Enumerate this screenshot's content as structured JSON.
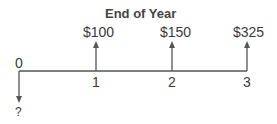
{
  "diagram": {
    "type": "cash-flow-timeline",
    "title": "End of Year",
    "periods": [
      {
        "label": "0",
        "cash_flow": "?",
        "direction": "down"
      },
      {
        "label": "1",
        "cash_flow": "$100",
        "direction": "up"
      },
      {
        "label": "2",
        "cash_flow": "$150",
        "direction": "up"
      },
      {
        "label": "3",
        "cash_flow": "$325",
        "direction": "up"
      }
    ]
  }
}
